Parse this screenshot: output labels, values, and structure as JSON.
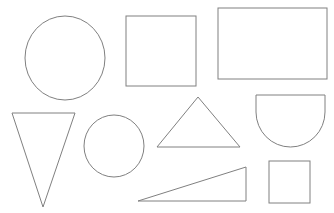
{
  "page": {
    "background_color": "#ffffff",
    "width": 334,
    "height": 213,
    "stroke_color": "#808080",
    "stroke_width": 1,
    "fill_color": "none"
  },
  "shapes": [
    {
      "id": "ellipse-large",
      "name": "Ellipse",
      "type": "ellipse",
      "cx": 65,
      "cy": 58,
      "rx": 40,
      "ry": 42,
      "stroke": "#808080",
      "fill": "none",
      "row": 1,
      "column": 1
    },
    {
      "id": "square-large",
      "name": "Square",
      "type": "rect",
      "x": 126,
      "y": 16,
      "width": 70,
      "height": 70,
      "stroke": "#808080",
      "fill": "none",
      "row": 1,
      "column": 2
    },
    {
      "id": "rectangle-wide",
      "name": "Rectangle",
      "type": "rect",
      "x": 218,
      "y": 8,
      "width": 109,
      "height": 71,
      "stroke": "#808080",
      "fill": "none",
      "row": 1,
      "column": 3
    },
    {
      "id": "triangle-inverted",
      "name": "Inverted Triangle",
      "type": "polygon",
      "points": "12,113 75,113 43,207",
      "stroke": "#808080",
      "fill": "none",
      "row": 2,
      "column": 1
    },
    {
      "id": "circle-small",
      "name": "Circle",
      "type": "ellipse",
      "cx": 114,
      "cy": 146,
      "rx": 30,
      "ry": 31,
      "stroke": "#808080",
      "fill": "none",
      "row": 2,
      "column": 2
    },
    {
      "id": "triangle-isosceles",
      "name": "Isosceles Triangle",
      "type": "polygon",
      "points": "198,97 240,147 157,147",
      "stroke": "#808080",
      "fill": "none",
      "row": 2,
      "column": 3
    },
    {
      "id": "semicircle",
      "name": "Semicircle",
      "type": "path",
      "d": "M 256 95 L 325 95 L 325 112 A 34.5 35 0 0 1 256 112 Z",
      "stroke": "#808080",
      "fill": "none",
      "row": 2,
      "column": 4
    },
    {
      "id": "triangle-right-thin",
      "name": "Right Triangle",
      "type": "polygon",
      "points": "138,201 246,167 246,201",
      "stroke": "#808080",
      "fill": "none",
      "row": 3,
      "column": 2
    },
    {
      "id": "square-small",
      "name": "Small Square",
      "type": "rect",
      "x": 269,
      "y": 161,
      "width": 41,
      "height": 42,
      "stroke": "#808080",
      "fill": "none",
      "row": 3,
      "column": 4
    }
  ]
}
